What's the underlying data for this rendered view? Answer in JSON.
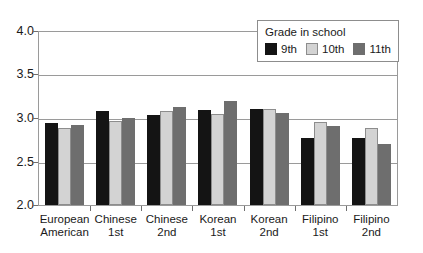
{
  "chart_data": {
    "type": "bar",
    "title": "",
    "xlabel": "",
    "ylabel": "",
    "ylim": [
      2.0,
      4.0
    ],
    "yticks": [
      "2.0",
      "2.5",
      "3.0",
      "3.5",
      "4.0"
    ],
    "grid": true,
    "legend_position": "top-right",
    "legend_title": "Grade in school",
    "categories": [
      {
        "line1": "European",
        "line2": "American"
      },
      {
        "line1": "Chinese",
        "line2": "1st"
      },
      {
        "line1": "Chinese",
        "line2": "2nd"
      },
      {
        "line1": "Korean",
        "line2": "1st"
      },
      {
        "line1": "Korean",
        "line2": "2nd"
      },
      {
        "line1": "Filipino",
        "line2": "1st"
      },
      {
        "line1": "Filipino",
        "line2": "2nd"
      }
    ],
    "series": [
      {
        "name": "9th",
        "color": "#141414",
        "values": [
          2.95,
          3.09,
          3.04,
          3.1,
          3.11,
          2.77,
          2.77
        ]
      },
      {
        "name": "10th",
        "color": "#d3d3d3",
        "values": [
          2.89,
          2.97,
          3.09,
          3.05,
          3.11,
          2.96,
          2.89
        ]
      },
      {
        "name": "11th",
        "color": "#6e6e6e",
        "values": [
          2.93,
          3.01,
          3.13,
          3.2,
          3.06,
          2.91,
          2.7
        ]
      }
    ]
  }
}
